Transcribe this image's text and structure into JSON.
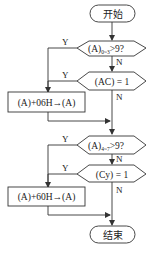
{
  "diagram": {
    "type": "flowchart",
    "nodes": {
      "start": {
        "label": "开始",
        "shape": "terminator"
      },
      "cond_low": {
        "label_main": "(A)",
        "label_sub": "0~3",
        "label_tail": ">9?",
        "shape": "decision"
      },
      "cond_ac": {
        "label": "(AC) = 1",
        "shape": "decision"
      },
      "add_06": {
        "label": "(A)+06H→(A)",
        "shape": "process"
      },
      "cond_high": {
        "label_main": "(A)",
        "label_sub": "4~7",
        "label_tail": ">9?",
        "shape": "decision"
      },
      "cond_cy": {
        "label": "(Cy) = 1",
        "shape": "decision"
      },
      "add_60": {
        "label": "(A)+60H→(A)",
        "shape": "process"
      },
      "end": {
        "label": "结束",
        "shape": "terminator"
      }
    },
    "branch_labels": {
      "yes": "Y",
      "no": "N"
    },
    "edges": [
      {
        "from": "start",
        "to": "cond_low",
        "label": ""
      },
      {
        "from": "cond_low",
        "to": "add_06",
        "label": "Y"
      },
      {
        "from": "cond_low",
        "to": "cond_ac",
        "label": "N"
      },
      {
        "from": "cond_ac",
        "to": "add_06",
        "label": "Y"
      },
      {
        "from": "cond_ac",
        "to": "cond_high",
        "label": "N"
      },
      {
        "from": "add_06",
        "to": "cond_high",
        "label": ""
      },
      {
        "from": "cond_high",
        "to": "add_60",
        "label": "Y"
      },
      {
        "from": "cond_high",
        "to": "cond_cy",
        "label": "N"
      },
      {
        "from": "cond_cy",
        "to": "add_60",
        "label": "Y"
      },
      {
        "from": "cond_cy",
        "to": "end",
        "label": "N"
      },
      {
        "from": "add_60",
        "to": "end",
        "label": ""
      }
    ]
  }
}
